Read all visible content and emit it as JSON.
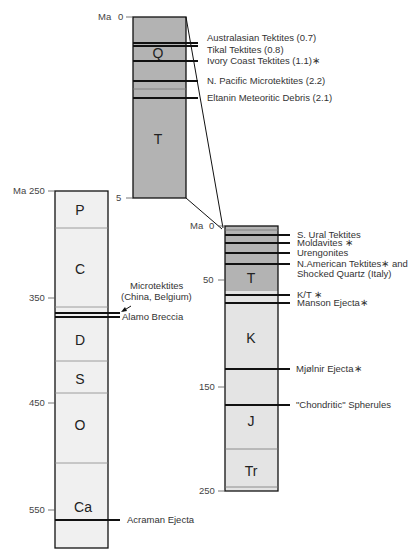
{
  "colors": {
    "cenozoic_fill": "#b3b3b3",
    "mesozoic_cenozoic_fill": "#e6e6e6",
    "paleozoic_fill": "#f0f0f0",
    "line": "#111111"
  },
  "top_column": {
    "axis_label": "Ma",
    "ticks": [
      "0",
      "5"
    ],
    "periods": [
      "Q",
      "T"
    ],
    "events": [
      "Australasian Tektites (0.7)",
      "Tikal Tektites (0.8)",
      "Ivory Coast Tektites (1.1)∗",
      "N. Pacific Microtektites (2.2)",
      "Eltanin Meteoritic Debris (2.1)"
    ]
  },
  "right_column": {
    "axis_label": "Ma",
    "ticks": [
      "0",
      "50",
      "150",
      "250"
    ],
    "periods": [
      "T",
      "K",
      "J",
      "Tr"
    ],
    "events": [
      "S. Ural Tektites",
      "Moldavites ∗",
      "Urengonites",
      "N.American Tektites∗ and",
      "Shocked Quartz (Italy)",
      "K/T ∗",
      "Manson Ejecta∗",
      "Mjølnir Ejecta∗",
      "\"Chondritic\" Spherules"
    ]
  },
  "left_column": {
    "axis_label": "Ma",
    "ticks": [
      "250",
      "350",
      "450",
      "550"
    ],
    "periods": [
      "P",
      "C",
      "D",
      "S",
      "O",
      "Ca"
    ],
    "events": [
      "Microtektites",
      "(China, Belgium)",
      "Alamo Breccia",
      "Acraman Ejecta"
    ]
  }
}
